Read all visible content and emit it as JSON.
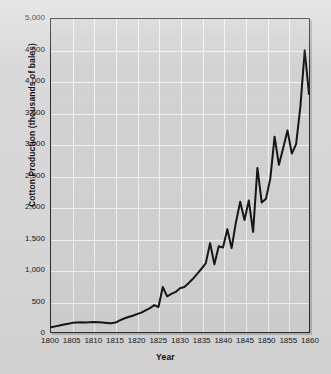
{
  "figure": {
    "background_color": "#d9d9d9",
    "plot_background_color": "#d2d2d2",
    "grid_color": "#f2f2f2",
    "line_color": "#161616",
    "axis_color": "#2b2b2b"
  },
  "chart_data": {
    "type": "line",
    "title": "",
    "subtitle": "",
    "xlabel": "Year",
    "ylabel": "Cotton Production (thousands of bales)",
    "xlim": [
      1800,
      1860
    ],
    "ylim": [
      0,
      5000
    ],
    "grid": true,
    "legend": null,
    "legend_position": "none",
    "xticks": [
      1800,
      1805,
      1810,
      1815,
      1820,
      1825,
      1830,
      1835,
      1840,
      1845,
      1850,
      1855,
      1860
    ],
    "xtick_labels": [
      "1800",
      "1805",
      "1810",
      "1815",
      "1820",
      "1825",
      "1830",
      "1835",
      "1840",
      "1845",
      "1850",
      "1855",
      "1860"
    ],
    "yticks": [
      0,
      500,
      1000,
      1500,
      2000,
      2500,
      3000,
      3500,
      4000,
      4500,
      5000
    ],
    "ytick_labels": [
      "0",
      "500",
      "1,000",
      "1,500",
      "2,000",
      "2,500",
      "3,000",
      "3,500",
      "4,000",
      "4,500",
      "5,000"
    ],
    "units": "thousands of bales",
    "series": [
      {
        "name": "Cotton Production",
        "color": "#161616",
        "x": [
          1800,
          1801,
          1802,
          1803,
          1804,
          1805,
          1806,
          1807,
          1808,
          1809,
          1810,
          1811,
          1812,
          1813,
          1814,
          1815,
          1816,
          1817,
          1818,
          1819,
          1820,
          1821,
          1822,
          1823,
          1824,
          1825,
          1826,
          1827,
          1828,
          1829,
          1830,
          1831,
          1832,
          1833,
          1834,
          1835,
          1836,
          1837,
          1838,
          1839,
          1840,
          1841,
          1842,
          1843,
          1844,
          1845,
          1846,
          1847,
          1848,
          1849,
          1850,
          1851,
          1852,
          1853,
          1854,
          1855,
          1856,
          1857,
          1858,
          1859,
          1860
        ],
        "y": [
          75,
          90,
          105,
          120,
          132,
          146,
          152,
          156,
          150,
          155,
          158,
          155,
          150,
          145,
          140,
          150,
          185,
          215,
          240,
          260,
          285,
          310,
          345,
          380,
          430,
          400,
          720,
          570,
          610,
          640,
          700,
          720,
          780,
          850,
          930,
          1010,
          1100,
          1420,
          1080,
          1370,
          1350,
          1640,
          1340,
          1750,
          2080,
          1790,
          2100,
          1600,
          2620,
          2070,
          2130,
          2450,
          3120,
          2670,
          2940,
          3220,
          2850,
          3000,
          3600,
          4500,
          3800
        ],
        "marker": "none",
        "linewidth": 2
      }
    ]
  },
  "axis_titles": {
    "y": "Cotton Production (thousands of bales)",
    "x": "Year"
  }
}
